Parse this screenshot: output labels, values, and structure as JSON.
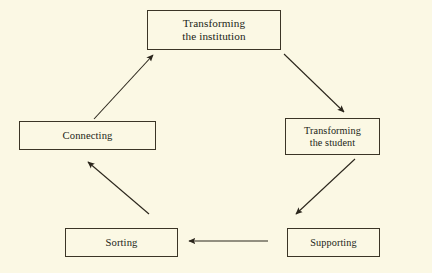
{
  "diagram": {
    "type": "cycle-flowchart",
    "background_color": "#fbf8e4",
    "line_color": "#3b3526",
    "nodes": [
      {
        "id": "institution",
        "label": "Transforming\nthe institution",
        "position": "top-center"
      },
      {
        "id": "student",
        "label": "Transforming\nthe student",
        "position": "middle-right"
      },
      {
        "id": "supporting",
        "label": "Supporting",
        "position": "bottom-right"
      },
      {
        "id": "sorting",
        "label": "Sorting",
        "position": "bottom-left"
      },
      {
        "id": "connecting",
        "label": "Connecting",
        "position": "middle-left"
      }
    ],
    "edges": [
      {
        "id": "connecting-to-institution",
        "from": "connecting",
        "to": "institution",
        "direction": "up-right"
      },
      {
        "id": "institution-to-student",
        "from": "institution",
        "to": "student",
        "direction": "down-right"
      },
      {
        "id": "student-to-supporting",
        "from": "student",
        "to": "supporting",
        "direction": "down-left"
      },
      {
        "id": "supporting-to-sorting",
        "from": "supporting",
        "to": "sorting",
        "direction": "left"
      },
      {
        "id": "sorting-to-connecting",
        "from": "sorting",
        "to": "connecting",
        "direction": "up-left"
      }
    ]
  }
}
